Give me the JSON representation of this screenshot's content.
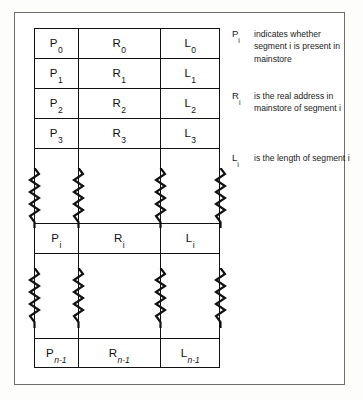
{
  "figure": {
    "accent_color": "#111111",
    "frame_color": "#6d6d6d",
    "background_color": "#ffffff"
  },
  "table": {
    "columns": [
      {
        "key": "present",
        "base": "P"
      },
      {
        "key": "real_address",
        "base": "R"
      },
      {
        "key": "length",
        "base": "L"
      }
    ],
    "rows": [
      {
        "type": "data",
        "subscript": "0",
        "italic_subscript": false,
        "cells": {
          "p_base": "P",
          "p_sub": "0",
          "r_base": "R",
          "r_sub": "0",
          "l_base": "L",
          "l_sub": "0"
        }
      },
      {
        "type": "data",
        "subscript": "1",
        "italic_subscript": false,
        "cells": {
          "p_base": "P",
          "p_sub": "1",
          "r_base": "R",
          "r_sub": "1",
          "l_base": "L",
          "l_sub": "1"
        }
      },
      {
        "type": "data",
        "subscript": "2",
        "italic_subscript": false,
        "cells": {
          "p_base": "P",
          "p_sub": "2",
          "r_base": "R",
          "r_sub": "2",
          "l_base": "L",
          "l_sub": "2"
        }
      },
      {
        "type": "data",
        "subscript": "3",
        "italic_subscript": false,
        "cells": {
          "p_base": "P",
          "p_sub": "3",
          "r_base": "R",
          "r_sub": "3",
          "l_base": "L",
          "l_sub": "3"
        }
      },
      {
        "type": "break",
        "label": "continuation-break-upper"
      },
      {
        "type": "data",
        "subscript": "i",
        "italic_subscript": false,
        "cells": {
          "p_base": "P",
          "p_sub": "i",
          "r_base": "R",
          "r_sub": "i",
          "l_base": "L",
          "l_sub": "i"
        }
      },
      {
        "type": "break",
        "label": "continuation-break-lower"
      },
      {
        "type": "data",
        "subscript": "n-1",
        "italic_subscript": true,
        "cells": {
          "p_base": "P",
          "p_sub": "n-1",
          "r_base": "R",
          "r_sub": "n-1",
          "l_base": "L",
          "l_sub": "n-1"
        }
      }
    ]
  },
  "annotations": [
    {
      "symbol_base": "P",
      "symbol_sub": "i",
      "text": "indicates whether segment i is present in mainstore"
    },
    {
      "symbol_base": "R",
      "symbol_sub": "i",
      "text": "is the real address in mainstore of segment i"
    },
    {
      "symbol_base": "L",
      "symbol_sub": "i",
      "text": "is the length of segment i"
    }
  ]
}
